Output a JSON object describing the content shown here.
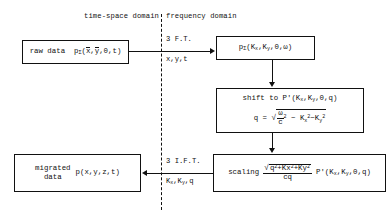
{
  "diagram": {
    "title_left": "time-space domain",
    "title_right": "frequency domain",
    "nodes": {
      "raw_data": {
        "label": "raw data",
        "expr_p": "p",
        "expr_sub": "Σ",
        "expr_args_x": "x",
        "expr_args_y": "y",
        "expr_args_rest": ",0,t)"
      },
      "spectrum": {
        "expr_p": "p",
        "expr_sub": "Σ",
        "open": "(K",
        "sub_x": "x",
        "mid": ",K",
        "sub_y": "y",
        "close": ",0,ω)"
      },
      "shift": {
        "line1_text": "shift to P'(K",
        "line1_sub_x": "x",
        "line1_mid": ",K",
        "line1_sub_y": "y",
        "line1_close": ",0,q)",
        "line2_lhs": "q  =",
        "sqrt": "√",
        "frac_num": "ω",
        "frac_den": "c",
        "pow2": "2",
        "minus": "−",
        "term_k": "K",
        "term_kx_sub": "x",
        "term_kx_pow": "2",
        "term_minus2": "−K",
        "term_ky_sub": "y",
        "term_ky_pow": "2"
      },
      "migrated": {
        "label_line1": "migrated",
        "label_line2": "data",
        "expr": "p(x,y,z,t)"
      },
      "scaling": {
        "label": "scaling",
        "num_sqrt": "√",
        "num_q": "q",
        "num_q_pow": "2",
        "num_kx": "+Kx",
        "num_kx_pow": "2",
        "num_ky": "+Ky",
        "num_ky_pow": "2",
        "den": "cq",
        "tail_open": "P'(K",
        "tail_sub_x": "x",
        "tail_mid": ",K",
        "tail_sub_y": "y",
        "tail_close": ",0,q)"
      }
    },
    "edges": {
      "forward_top": "3 F.T.",
      "forward_bottom": "x,y,t",
      "inverse_top": "3 I.F.T.",
      "inverse_bottom_k": "K",
      "inverse_bottom_sub_x": "x",
      "inverse_bottom_mid": ",K",
      "inverse_bottom_sub_y": "y",
      "inverse_bottom_close": ",q"
    }
  }
}
